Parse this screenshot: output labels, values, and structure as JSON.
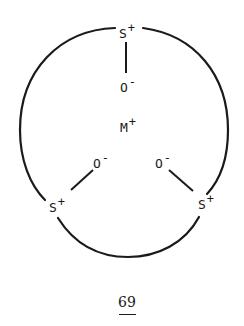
{
  "diagram": {
    "type": "chemical-structure",
    "center_ion": {
      "symbol": "M",
      "charge": "+"
    },
    "ring_atoms": [
      {
        "id": "s_top",
        "symbol": "S",
        "charge": "+",
        "oxygen": {
          "symbol": "O",
          "charge": "-"
        }
      },
      {
        "id": "s_left",
        "symbol": "S",
        "charge": "+",
        "oxygen": {
          "symbol": "O",
          "charge": "-"
        }
      },
      {
        "id": "s_right",
        "symbol": "S",
        "charge": "+",
        "oxygen": {
          "symbol": "O",
          "charge": "-"
        }
      }
    ],
    "compound_label": "69",
    "compound_label_underlined": true,
    "colors": {
      "ink": "#1a1a1a",
      "background": "#ffffff"
    }
  }
}
